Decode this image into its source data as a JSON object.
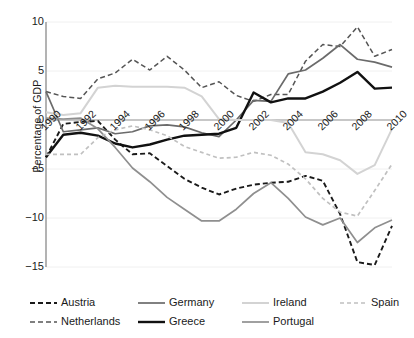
{
  "chart_data": {
    "type": "line",
    "title": "",
    "xlabel": "",
    "ylabel": "Percentage of GDP",
    "xlim": [
      1990,
      2010
    ],
    "ylim": [
      -15,
      10
    ],
    "yticks": [
      10,
      5,
      0,
      -5,
      -10,
      -15
    ],
    "ytick_labels": [
      "10",
      "5",
      "0",
      "−5",
      "−10",
      "−15"
    ],
    "xticks": [
      1990,
      1992,
      1994,
      1996,
      1998,
      2000,
      2002,
      2004,
      2006,
      2008,
      2010
    ],
    "xtick_labels": [
      "1990",
      "1992",
      "1994",
      "1996",
      "1998",
      "2000",
      "2002",
      "2004",
      "2006",
      "2008",
      "2010"
    ],
    "grid": true,
    "grid_axis": "y",
    "legend_position": "below",
    "legend_columns": 4,
    "x": [
      1990,
      1991,
      1992,
      1993,
      1994,
      1995,
      1996,
      1997,
      1998,
      1999,
      2000,
      2001,
      2002,
      2003,
      2004,
      2005,
      2006,
      2007,
      2008,
      2009,
      2010
    ],
    "series": [
      {
        "name": "Austria",
        "color": "#1a1a1a",
        "style": "dashed",
        "width": 1.9,
        "dash": "5,3",
        "values": [
          -3.8,
          -0.4,
          -0.2,
          -0.1,
          -2.0,
          -3.5,
          -3.4,
          -4.7,
          -6.0,
          -6.9,
          -7.6,
          -7.0,
          -6.6,
          -6.4,
          -6.3,
          -5.7,
          -6.2,
          -9.6,
          -14.5,
          -14.8,
          -10.8
        ]
      },
      {
        "name": "Netherlands",
        "color": "#555555",
        "style": "dashed",
        "width": 1.5,
        "dash": "5,3",
        "values": [
          2.9,
          2.4,
          2.2,
          4.2,
          4.8,
          6.2,
          5.1,
          6.5,
          5.1,
          3.3,
          3.9,
          2.5,
          1.9,
          2.6,
          2.6,
          6.0,
          7.7,
          7.5,
          9.5,
          6.5,
          7.2
        ]
      },
      {
        "name": "Germany",
        "color": "#6b6b6b",
        "style": "solid",
        "width": 1.7,
        "dash": "",
        "values": [
          2.9,
          -1.2,
          -1.0,
          -0.8,
          -1.4,
          -1.2,
          -0.6,
          -0.5,
          -0.7,
          -1.3,
          -1.7,
          0.0,
          2.0,
          1.9,
          4.7,
          5.1,
          6.3,
          7.7,
          6.2,
          5.9,
          5.4
        ]
      },
      {
        "name": "Greece",
        "color": "#111111",
        "style": "solid",
        "width": 2.4,
        "dash": "",
        "values": [
          -3.8,
          -1.5,
          -1.3,
          -1.6,
          -2.4,
          -2.8,
          -2.5,
          -2.0,
          -1.6,
          -1.5,
          -1.4,
          -0.8,
          2.8,
          1.8,
          2.2,
          2.2,
          2.9,
          3.8,
          4.9,
          3.2,
          3.3
        ]
      },
      {
        "name": "Ireland",
        "color": "#d3d3d3",
        "style": "solid",
        "width": 2.0,
        "dash": "",
        "values": [
          0.8,
          0.5,
          0.7,
          3.3,
          3.5,
          3.4,
          3.4,
          3.4,
          3.3,
          2.4,
          0.1,
          0.0,
          0.0,
          0.0,
          -0.3,
          -3.3,
          -3.5,
          -4.1,
          -5.5,
          -4.6,
          -0.9
        ]
      },
      {
        "name": "Portugal",
        "color": "#8f8f8f",
        "style": "solid",
        "width": 1.7,
        "dash": "",
        "values": [
          0.2,
          0.1,
          0.2,
          -0.9,
          -2.8,
          -4.9,
          -6.3,
          -7.9,
          -9.1,
          -10.3,
          -10.3,
          -9.1,
          -7.5,
          -6.4,
          -8.0,
          -9.9,
          -10.7,
          -10.0,
          -12.5,
          -11.0,
          -10.2
        ]
      },
      {
        "name": "Spain",
        "color": "#c0c0c0",
        "style": "dashed",
        "width": 1.7,
        "dash": "4,3",
        "values": [
          -3.5,
          -3.5,
          -3.5,
          -1.8,
          -1.0,
          -0.6,
          -1.0,
          -1.6,
          -2.7,
          -3.3,
          -3.9,
          -3.8,
          -3.3,
          -3.6,
          -4.5,
          -6.0,
          -8.0,
          -9.4,
          -9.8,
          -7.2,
          -4.5
        ]
      }
    ]
  },
  "legend": {
    "rows": [
      [
        {
          "label": "Austria",
          "series": "Austria"
        },
        {
          "label": "Germany",
          "series": "Germany"
        },
        {
          "label": "Ireland",
          "series": "Ireland"
        },
        {
          "label": "Spain",
          "series": "Spain"
        }
      ],
      [
        {
          "label": "Netherlands",
          "series": "Netherlands"
        },
        {
          "label": "Greece",
          "series": "Greece"
        },
        {
          "label": "Portugal",
          "series": "Portugal"
        }
      ]
    ]
  },
  "style": {
    "background": "#ffffff",
    "axis_color": "#808080",
    "grid_color": "#f0f0f0",
    "zero_line_color": "#909090",
    "text_color": "#1a1a1a"
  }
}
